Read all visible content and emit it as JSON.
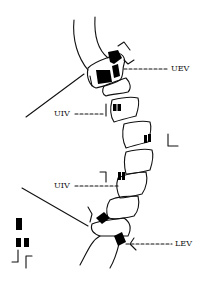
{
  "figure": {
    "type": "spine-scoliosis-diagram",
    "background": "#ffffff",
    "stroke_color": "#111111",
    "fill_color": "#000000"
  },
  "labels": {
    "uev": "UEV",
    "uiv_upper": "UIV",
    "uiv_lower": "UIV",
    "lev": "LEV"
  },
  "legend": {
    "icons": [
      "single-block-icon",
      "double-block-icon",
      "arrow-up-icon",
      "arrow-down-icon"
    ]
  }
}
